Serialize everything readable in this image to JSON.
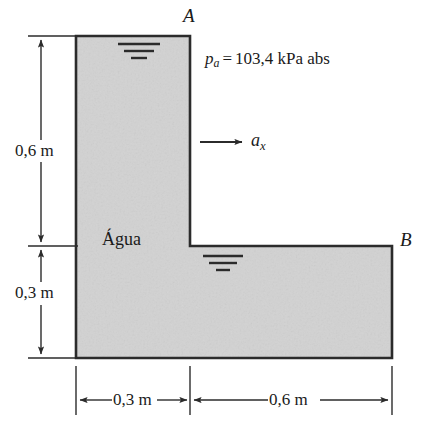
{
  "figure": {
    "type": "engineering-diagram",
    "fill_color": "#d2d2d2",
    "outline_color": "#2b2b2b",
    "background_color": "#ffffff"
  },
  "labels": {
    "corner_a": "A",
    "corner_b": "B",
    "fluid": "Água",
    "pressure_symbol": "p",
    "pressure_subscript": "a",
    "pressure_equals": "=",
    "pressure_value": "103,4 kPa abs",
    "acceleration_symbol": "a",
    "acceleration_subscript": "x"
  },
  "dimensions": {
    "vertical_upper": "0,6 m",
    "vertical_lower": "0,3 m",
    "horizontal_left": "0,3 m",
    "horizontal_right": "0,6 m"
  },
  "icons": {
    "water_surface_upper": "water-surface-symbol",
    "water_surface_lower": "water-surface-symbol",
    "acceleration_arrow": "arrow-right-icon"
  }
}
